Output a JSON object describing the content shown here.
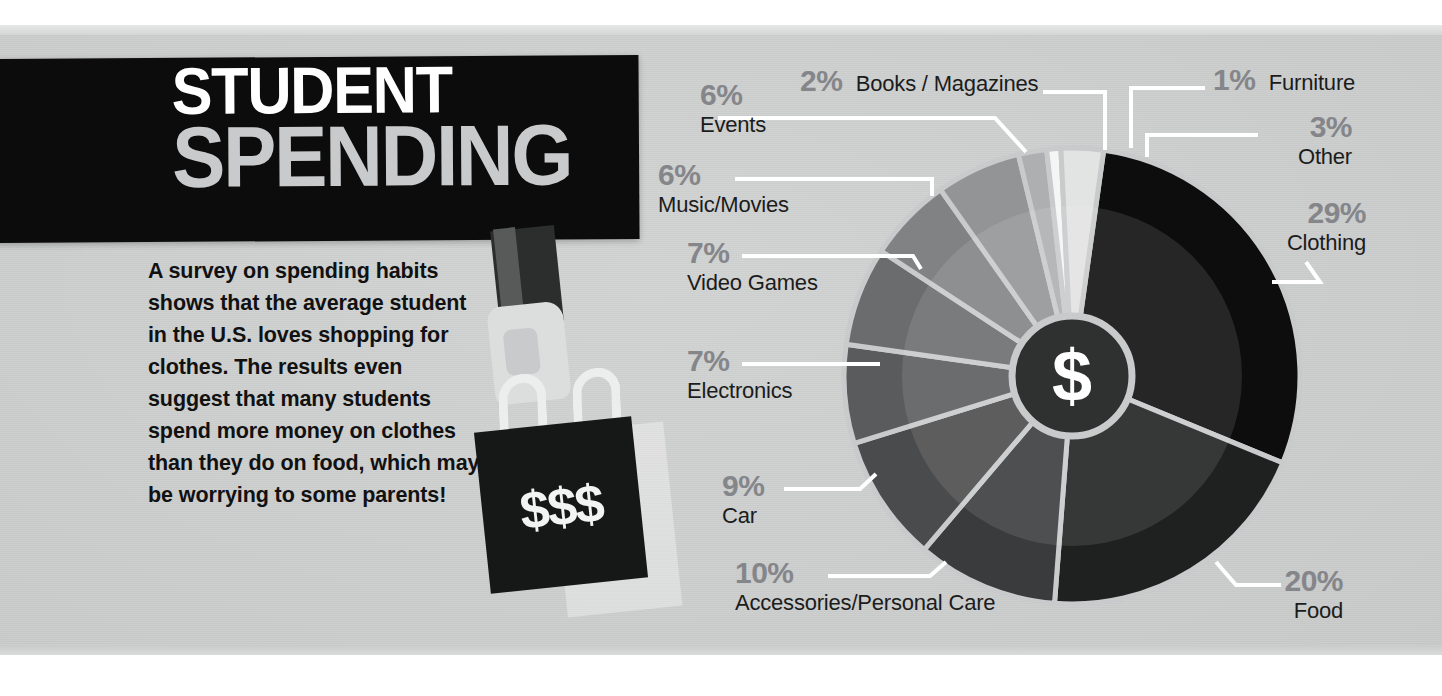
{
  "poster": {
    "title_line1": "STUDENT",
    "title_line2": "SPENDING",
    "body_text": "A survey on spending habits shows that the average student in the U.S. loves shopping for clothes. The results even suggest that many students spend more money on clothes than they do on food, which may be worrying to some parents!",
    "bag_label": "$$$",
    "center_symbol": "$"
  },
  "colors": {
    "background": "#cacbcb",
    "title_block": "#0c0c0c",
    "title_line1": "#ffffff",
    "title_line2": "#c9cacb",
    "percent_text": "#84868a",
    "category_text": "#1b1c1c",
    "leader_line": "#ffffff",
    "bag": "#161717",
    "arm": "#2c2d2d",
    "hand": "#dcdddd"
  },
  "chart_data": {
    "type": "pie",
    "title": "Student Spending",
    "unit": "%",
    "legend_position": "callouts",
    "center_label": "$",
    "categories": [
      "Clothing",
      "Food",
      "Accessories/Personal Care",
      "Car",
      "Electronics",
      "Video Games",
      "Music/Movies",
      "Events",
      "Books / Magazines",
      "Furniture",
      "Other"
    ],
    "values": [
      29,
      20,
      10,
      9,
      7,
      7,
      6,
      6,
      2,
      1,
      3
    ],
    "slice_colors": [
      "#0d0d0d",
      "#1f2020",
      "#3a3b3c",
      "#4a4b4c",
      "#5a5b5c",
      "#6b6c6d",
      "#818283",
      "#939495",
      "#aeafb0",
      "#f4f5f5",
      "#e2e3e3"
    ],
    "slices": [
      {
        "label": "Clothing",
        "percent": 29,
        "pct_text": "29%",
        "color": "#0d0d0d"
      },
      {
        "label": "Food",
        "percent": 20,
        "pct_text": "20%",
        "color": "#1f2020"
      },
      {
        "label": "Accessories/Personal Care",
        "percent": 10,
        "pct_text": "10%",
        "color": "#3a3b3c"
      },
      {
        "label": "Car",
        "percent": 9,
        "pct_text": "9%",
        "color": "#4a4b4c"
      },
      {
        "label": "Electronics",
        "percent": 7,
        "pct_text": "7%",
        "color": "#5a5b5c"
      },
      {
        "label": "Video Games",
        "percent": 7,
        "pct_text": "7%",
        "color": "#6b6c6d"
      },
      {
        "label": "Music/Movies",
        "percent": 6,
        "pct_text": "6%",
        "color": "#818283"
      },
      {
        "label": "Events",
        "percent": 6,
        "pct_text": "6%",
        "color": "#939495"
      },
      {
        "label": "Books / Magazines",
        "percent": 2,
        "pct_text": "2%",
        "color": "#aeafb0"
      },
      {
        "label": "Furniture",
        "percent": 1,
        "pct_text": "1%",
        "color": "#f4f5f5"
      },
      {
        "label": "Other",
        "percent": 3,
        "pct_text": "3%",
        "color": "#e2e3e3"
      }
    ]
  }
}
